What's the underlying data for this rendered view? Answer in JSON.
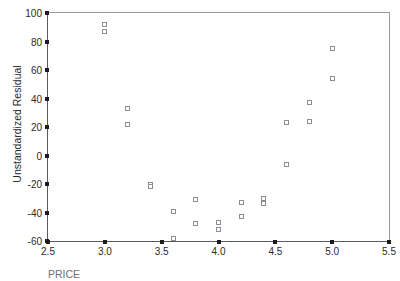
{
  "chart_data": {
    "type": "scatter",
    "title": "",
    "xlabel": "PRICE",
    "ylabel": "Unstandardized Residual",
    "xlim": [
      2.5,
      5.5
    ],
    "ylim": [
      -60,
      100
    ],
    "grid": false,
    "legend": null,
    "marker": "open-square",
    "marker_color": "#8d8d96",
    "xticks": [
      "2.5",
      "3.0",
      "3.5",
      "4.0",
      "4.5",
      "5.0",
      "5.5"
    ],
    "xtick_values": [
      2.5,
      3.0,
      3.5,
      4.0,
      4.5,
      5.0,
      5.5
    ],
    "yticks": [
      "100",
      "80",
      "60",
      "40",
      "20",
      "0",
      "-20",
      "-40",
      "-60"
    ],
    "ytick_values": [
      100,
      80,
      60,
      40,
      20,
      0,
      -20,
      -40,
      -60
    ],
    "points": [
      {
        "x": 3.0,
        "y": 92
      },
      {
        "x": 3.0,
        "y": 87
      },
      {
        "x": 3.2,
        "y": 33
      },
      {
        "x": 3.2,
        "y": 22
      },
      {
        "x": 3.4,
        "y": -20
      },
      {
        "x": 3.4,
        "y": -22
      },
      {
        "x": 3.6,
        "y": -39
      },
      {
        "x": 3.6,
        "y": -58
      },
      {
        "x": 3.8,
        "y": -31
      },
      {
        "x": 3.8,
        "y": -48
      },
      {
        "x": 4.0,
        "y": -47
      },
      {
        "x": 4.0,
        "y": -52
      },
      {
        "x": 4.2,
        "y": -33
      },
      {
        "x": 4.2,
        "y": -43
      },
      {
        "x": 4.4,
        "y": -30
      },
      {
        "x": 4.4,
        "y": -34
      },
      {
        "x": 4.6,
        "y": 23
      },
      {
        "x": 4.6,
        "y": -6
      },
      {
        "x": 4.8,
        "y": 37
      },
      {
        "x": 4.8,
        "y": 24
      },
      {
        "x": 5.0,
        "y": 75
      },
      {
        "x": 5.0,
        "y": 54
      }
    ]
  },
  "axes": {
    "y_title": "Unstandardized Residual",
    "x_title": "PRICE"
  },
  "colors": {
    "axis": "#5a5a60",
    "frame": "#9a9aa0",
    "marker_outline": "#8d8d96",
    "text": "#2b2b2b",
    "background": "#ffffff"
  }
}
